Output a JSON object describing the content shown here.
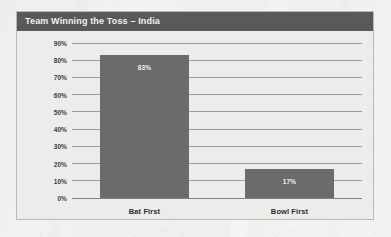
{
  "panel": {
    "title": "Team Winning the Toss – India"
  },
  "chart_data": {
    "type": "bar",
    "title": "Team Winning the Toss – India",
    "xlabel": "",
    "ylabel": "",
    "categories": [
      "Bat First",
      "Bowl First"
    ],
    "values": [
      83,
      17
    ],
    "value_labels": [
      "83%",
      "17%"
    ],
    "ylim": [
      0,
      90
    ],
    "ytick_values": [
      0,
      10,
      20,
      30,
      40,
      50,
      60,
      70,
      80,
      90
    ],
    "ytick_labels": [
      "0%",
      "10%",
      "20%",
      "30%",
      "40%",
      "50%",
      "60%",
      "70%",
      "80%",
      "90%"
    ],
    "grid": true,
    "legend": false,
    "series": [
      {
        "name": "Toss outcome share",
        "values": [
          83,
          17
        ]
      }
    ]
  },
  "colors": {
    "header_bar": "#595959",
    "header_text": "#f1f1f1",
    "panel_background": "#ececeb",
    "panel_border": "#b9b9b7",
    "bar_fill": "#6b6b6b",
    "bar_label_text": "#f0f0f0",
    "gridline": "#8e8e8c",
    "axis_text": "#3d3d3d",
    "page_background": "#f2f2f0"
  }
}
